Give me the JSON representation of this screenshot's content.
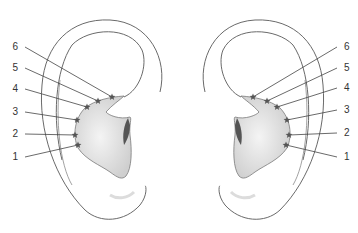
{
  "figure": {
    "left_ear": {
      "labels": [
        {
          "n": "6",
          "lx": 22,
          "ly": 50,
          "sx": 112,
          "sy": 97
        },
        {
          "n": "5",
          "lx": 22,
          "ly": 71,
          "sx": 98,
          "sy": 101
        },
        {
          "n": "4",
          "lx": 22,
          "ly": 92,
          "sx": 87,
          "sy": 107
        },
        {
          "n": "3",
          "lx": 22,
          "ly": 115,
          "sx": 77,
          "sy": 120
        },
        {
          "n": "2",
          "lx": 22,
          "ly": 137,
          "sx": 75,
          "sy": 135
        },
        {
          "n": "1",
          "lx": 22,
          "ly": 160,
          "sx": 78,
          "sy": 145
        }
      ]
    },
    "right_ear": {
      "labels": [
        {
          "n": "6",
          "lx": 340,
          "ly": 50,
          "sx": 253,
          "sy": 97
        },
        {
          "n": "5",
          "lx": 340,
          "ly": 71,
          "sx": 267,
          "sy": 101
        },
        {
          "n": "4",
          "lx": 340,
          "ly": 91,
          "sx": 277,
          "sy": 107
        },
        {
          "n": "3",
          "lx": 340,
          "ly": 113,
          "sx": 287,
          "sy": 120
        },
        {
          "n": "2",
          "lx": 340,
          "ly": 136,
          "sx": 289,
          "sy": 135
        },
        {
          "n": "1",
          "lx": 340,
          "ly": 160,
          "sx": 286,
          "sy": 145
        }
      ]
    },
    "colors": {
      "outline": "#6a6a6a",
      "shading": "#cfcfcf",
      "canal": "#555555",
      "marker": "#555555"
    }
  }
}
